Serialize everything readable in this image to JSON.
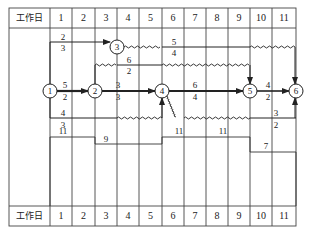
{
  "header": {
    "label": "工作日",
    "days": [
      "1",
      "2",
      "3",
      "4",
      "5",
      "6",
      "7",
      "8",
      "9",
      "10",
      "11"
    ]
  },
  "footer": {
    "label": "工作日",
    "days": [
      "1",
      "2",
      "3",
      "4",
      "5",
      "6",
      "7",
      "8",
      "9",
      "10",
      "11"
    ]
  },
  "nodes": [
    {
      "id": "1",
      "label": "1"
    },
    {
      "id": "2",
      "label": "2"
    },
    {
      "id": "3",
      "label": "3"
    },
    {
      "id": "4",
      "label": "4"
    },
    {
      "id": "5",
      "label": "5"
    },
    {
      "id": "6",
      "label": "6"
    }
  ],
  "activities": [
    {
      "from": "1",
      "to": "3",
      "resource": "2",
      "duration": "3"
    },
    {
      "from": "3",
      "to": "6",
      "resource": "5",
      "duration": "4"
    },
    {
      "from": "2",
      "to": "5",
      "resource": "6",
      "duration": "2"
    },
    {
      "from": "1",
      "to": "2",
      "resource": "5",
      "duration": "2"
    },
    {
      "from": "2",
      "to": "4",
      "resource": "3",
      "duration": "3"
    },
    {
      "from": "4",
      "to": "5",
      "resource": "6",
      "duration": "4"
    },
    {
      "from": "5",
      "to": "6",
      "resource": "4",
      "duration": "2"
    },
    {
      "from": "1",
      "to": "4",
      "resource": "4",
      "duration": "3"
    },
    {
      "from": "4",
      "to": "6",
      "resource": "3",
      "duration": "2"
    }
  ],
  "resource_histogram": [
    {
      "days": "1-2",
      "value": "11"
    },
    {
      "days": "3-5",
      "value": "9"
    },
    {
      "days": "6-7",
      "value": "11"
    },
    {
      "days": "8-9",
      "value": "11"
    },
    {
      "days": "10-11",
      "value": "7"
    }
  ],
  "colors": {
    "line": "#333333",
    "critical": "#222222",
    "background": "#ffffff"
  }
}
